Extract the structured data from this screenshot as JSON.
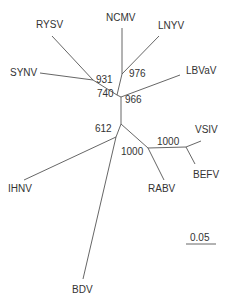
{
  "figure": {
    "type": "unrooted phylogenetic tree",
    "line_color": "#555555",
    "text_color": "#333333"
  },
  "taxa": {
    "rysv": "RYSV",
    "ncmv": "NCMV",
    "lnyv": "LNYV",
    "synv": "SYNV",
    "lbvav": "LBVaV",
    "vsiv": "VSIV",
    "befv": "BEFV",
    "ihnv": "IHNV",
    "rabv": "RABV",
    "bdv": "BDV"
  },
  "bootstrap": {
    "b931": "931",
    "b976": "976",
    "b740": "740",
    "b966": "966",
    "b612": "612",
    "b1000_vsiv": "1000",
    "b1000_rabv": "1000"
  },
  "scale_bar": {
    "label": "0.05"
  }
}
